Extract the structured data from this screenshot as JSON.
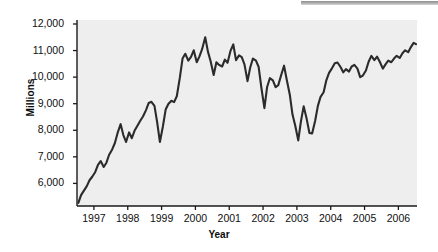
{
  "figure": {
    "top_bar_color": "#9a9a9a",
    "plot_bg_color": "#eeeeee",
    "line_color": "#2b2b2b",
    "axis_color": "#1a1a1a"
  },
  "chart_data": {
    "type": "line",
    "title": "",
    "xlabel": "Year",
    "ylabel": "Millions",
    "grid": false,
    "legend": null,
    "xlim": [
      1996.5,
      2006.55
    ],
    "ylim": [
      5150,
      12150
    ],
    "ytick_labels": [
      "6,000",
      "7,000",
      "8,000",
      "9,000",
      "10,000",
      "11,000",
      "12,000"
    ],
    "ytick_values": [
      6000,
      7000,
      8000,
      9000,
      10000,
      11000,
      12000
    ],
    "xtick_labels": [
      "1997",
      "1998",
      "1999",
      "2000",
      "2001",
      "2002",
      "2003",
      "2004",
      "2005",
      "2006"
    ],
    "xtick_values": [
      1997,
      1998,
      1999,
      2000,
      2001,
      2002,
      2003,
      2004,
      2005,
      2006
    ],
    "series": [
      {
        "name": "Millions",
        "x": [
          1996.54,
          1996.62,
          1996.7,
          1996.79,
          1996.87,
          1996.95,
          1997.04,
          1997.12,
          1997.2,
          1997.29,
          1997.37,
          1997.45,
          1997.54,
          1997.62,
          1997.7,
          1997.79,
          1997.87,
          1997.95,
          1998.04,
          1998.12,
          1998.2,
          1998.29,
          1998.37,
          1998.45,
          1998.54,
          1998.62,
          1998.7,
          1998.79,
          1998.87,
          1998.95,
          1999.04,
          1999.12,
          1999.2,
          1999.29,
          1999.37,
          1999.45,
          1999.54,
          1999.62,
          1999.7,
          1999.79,
          1999.87,
          1999.95,
          2000.04,
          2000.12,
          2000.2,
          2000.29,
          2000.37,
          2000.45,
          2000.54,
          2000.62,
          2000.7,
          2000.79,
          2000.87,
          2000.95,
          2001.04,
          2001.12,
          2001.2,
          2001.29,
          2001.37,
          2001.45,
          2001.54,
          2001.62,
          2001.7,
          2001.79,
          2001.87,
          2001.95,
          2002.04,
          2002.12,
          2002.2,
          2002.29,
          2002.37,
          2002.45,
          2002.54,
          2002.62,
          2002.7,
          2002.79,
          2002.87,
          2002.95,
          2003.04,
          2003.12,
          2003.2,
          2003.29,
          2003.37,
          2003.45,
          2003.54,
          2003.62,
          2003.7,
          2003.79,
          2003.87,
          2003.95,
          2004.04,
          2004.12,
          2004.2,
          2004.29,
          2004.37,
          2004.45,
          2004.54,
          2004.62,
          2004.7,
          2004.79,
          2004.87,
          2004.95,
          2005.04,
          2005.12,
          2005.2,
          2005.29,
          2005.37,
          2005.45,
          2005.54,
          2005.62,
          2005.7,
          2005.79,
          2005.87,
          2005.95,
          2006.04,
          2006.12,
          2006.2,
          2006.29,
          2006.37,
          2006.45,
          2006.52
        ],
        "values": [
          5270,
          5560,
          5720,
          5900,
          6120,
          6250,
          6430,
          6700,
          6840,
          6620,
          6780,
          7080,
          7280,
          7520,
          7900,
          8230,
          7820,
          7560,
          7920,
          7700,
          7980,
          8180,
          8360,
          8520,
          8760,
          9030,
          9070,
          8920,
          8300,
          7560,
          8150,
          8780,
          8990,
          9110,
          9060,
          9280,
          9980,
          10700,
          10880,
          10620,
          10760,
          11010,
          10560,
          10780,
          11060,
          11500,
          10960,
          10600,
          10080,
          10560,
          10460,
          10400,
          10660,
          10540,
          11000,
          11230,
          10640,
          10820,
          10750,
          10480,
          9850,
          10360,
          10700,
          10620,
          10380,
          9600,
          8830,
          9630,
          9960,
          9880,
          9620,
          9700,
          10100,
          10430,
          9900,
          9340,
          8590,
          8180,
          7620,
          8340,
          8900,
          8420,
          7900,
          7880,
          8360,
          8920,
          9260,
          9430,
          9880,
          10160,
          10340,
          10520,
          10550,
          10380,
          10180,
          10300,
          10210,
          10400,
          10460,
          10320,
          10000,
          10060,
          10250,
          10580,
          10800,
          10640,
          10770,
          10580,
          10320,
          10480,
          10620,
          10560,
          10700,
          10800,
          10720,
          10900,
          11010,
          10940,
          11130,
          11290,
          11240
        ]
      }
    ]
  }
}
